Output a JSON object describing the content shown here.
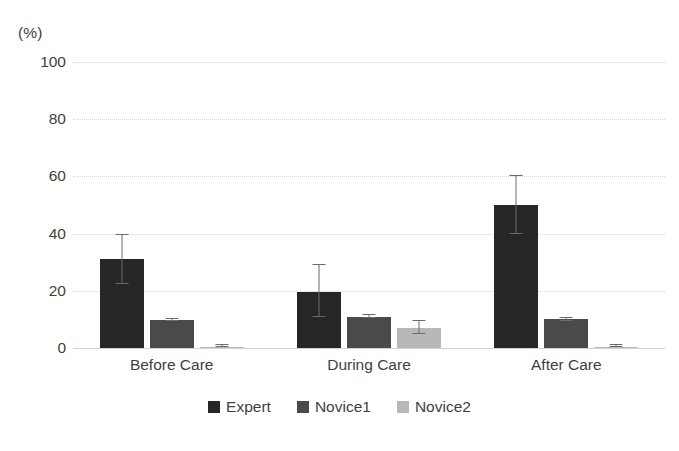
{
  "chart_data": {
    "type": "bar",
    "title": "",
    "subtitle": "",
    "xlabel": "",
    "ylabel": "",
    "unit_label": "(%)",
    "ylim": [
      0,
      100
    ],
    "yticks": [
      100,
      80,
      60,
      40,
      20,
      0
    ],
    "grid": true,
    "legend_position": "bottom",
    "categories": [
      "Before Care",
      "During Care",
      "After Care"
    ],
    "series": [
      {
        "name": "Expert",
        "color": "#262626",
        "values": [
          31,
          19.5,
          50
        ],
        "err_low": [
          22.5,
          11,
          40
        ],
        "err_high": [
          39.5,
          29,
          60
        ]
      },
      {
        "name": "Novice1",
        "color": "#4a4a4a",
        "values": [
          9.8,
          11,
          10
        ],
        "err_low": [
          9.3,
          10.6,
          9.5
        ],
        "err_high": [
          10.3,
          11.5,
          10.5
        ]
      },
      {
        "name": "Novice2",
        "color": "#b8b8b8",
        "values": [
          0.5,
          7,
          0.5
        ],
        "err_low": [
          0.2,
          5,
          0.2
        ],
        "err_high": [
          1.2,
          9.5,
          1.2
        ]
      }
    ]
  }
}
